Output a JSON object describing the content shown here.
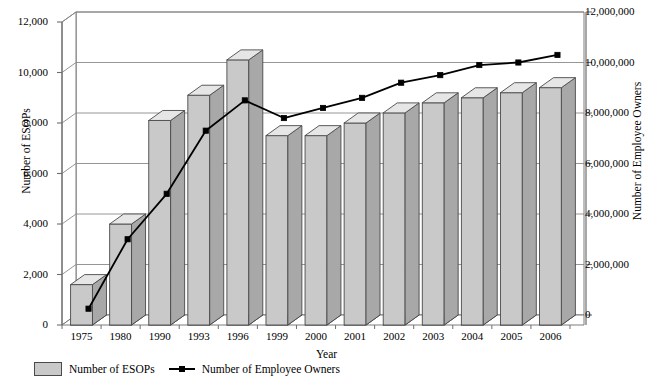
{
  "chart_data": {
    "type": "bar",
    "title": "",
    "xlabel": "Year",
    "ylabel": "Number of ESOPs",
    "y2label": "Number of Employee Owners",
    "categories": [
      "1975",
      "1980",
      "1990",
      "1993",
      "1996",
      "1999",
      "2000",
      "2001",
      "2002",
      "2003",
      "2004",
      "2005",
      "2006"
    ],
    "ylim": [
      0,
      12000
    ],
    "y2lim": [
      0,
      12000000
    ],
    "yticks": [
      "0",
      "2,000",
      "4,000",
      "6,000",
      "8,000",
      "10,000",
      "12,000"
    ],
    "ytick_values": [
      0,
      2000,
      4000,
      6000,
      8000,
      10000,
      12000
    ],
    "y2ticks": [
      "0",
      "2,000,000",
      "4,000,000",
      "6,000,000",
      "8,000,000",
      "10,000,000",
      "12,000,000"
    ],
    "y2tick_values": [
      0,
      2000000,
      4000000,
      6000000,
      8000000,
      10000000,
      12000000
    ],
    "grid": true,
    "legend_position": "bottom-left",
    "series": [
      {
        "name": "Number of ESOPs",
        "type": "bar",
        "axis": "left",
        "color": "#c9c9c9",
        "values": [
          1600,
          4000,
          8100,
          9100,
          10500,
          7500,
          7500,
          8000,
          8400,
          8800,
          9000,
          9200,
          9400
        ]
      },
      {
        "name": "Number of Employee Owners",
        "type": "line",
        "axis": "right",
        "color": "#000000",
        "values": [
          250000,
          3000000,
          4800000,
          7300000,
          8500000,
          7800000,
          8200000,
          8600000,
          9200000,
          9500000,
          9900000,
          10000000,
          10300000
        ]
      }
    ]
  },
  "legend": {
    "bar_label": "Number of ESOPs",
    "line_label": "Number of Employee Owners"
  },
  "colors": {
    "bar_face": "#c9c9c9",
    "bar_top": "#e6e6e6",
    "bar_side": "#a8a8a8",
    "bar_edge": "#4a4a4a",
    "line": "#000000",
    "grid": "#8a8a8a",
    "axis": "#6e6e6e",
    "floor": "#000000"
  }
}
